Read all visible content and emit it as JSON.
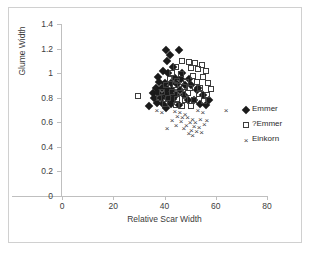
{
  "chart_data": {
    "type": "scatter",
    "title": "",
    "xlabel": "Relative Scar Width",
    "ylabel": "Glume Width",
    "xlim": [
      0,
      80
    ],
    "ylim": [
      0,
      1.4
    ],
    "xticks": [
      0,
      20,
      40,
      60,
      80
    ],
    "yticks": [
      0,
      0.2,
      0.4,
      0.6,
      0.8,
      1,
      1.2,
      1.4
    ],
    "xtick_labels": [
      "0",
      "20",
      "40",
      "60",
      "80"
    ],
    "ytick_labels": [
      "0",
      "0.2",
      "0.4",
      "0.6",
      "0.8",
      "1",
      "1.2",
      "1.4"
    ],
    "grid": false,
    "legend_position": "right",
    "series": [
      {
        "name": "Emmer",
        "marker": "filled-diamond",
        "color": "#1a1a1a",
        "points": [
          [
            40.5,
            1.19
          ],
          [
            42.0,
            1.15
          ],
          [
            45.5,
            1.19
          ],
          [
            41.0,
            1.1
          ],
          [
            43.5,
            1.05
          ],
          [
            39.5,
            1.02
          ],
          [
            41.5,
            1.0
          ],
          [
            47.0,
            1.0
          ],
          [
            37.5,
            0.97
          ],
          [
            44.0,
            0.96
          ],
          [
            46.5,
            0.95
          ],
          [
            49.5,
            0.95
          ],
          [
            38.0,
            0.93
          ],
          [
            40.0,
            0.92
          ],
          [
            42.5,
            0.92
          ],
          [
            45.0,
            0.91
          ],
          [
            48.0,
            0.9
          ],
          [
            50.5,
            0.9
          ],
          [
            36.5,
            0.88
          ],
          [
            39.0,
            0.88
          ],
          [
            41.0,
            0.87
          ],
          [
            43.0,
            0.86
          ],
          [
            46.0,
            0.86
          ],
          [
            52.5,
            0.86
          ],
          [
            35.5,
            0.84
          ],
          [
            37.5,
            0.84
          ],
          [
            40.0,
            0.83
          ],
          [
            42.0,
            0.83
          ],
          [
            44.5,
            0.82
          ],
          [
            47.5,
            0.82
          ],
          [
            55.0,
            0.82
          ],
          [
            36.0,
            0.8
          ],
          [
            38.5,
            0.8
          ],
          [
            41.5,
            0.79
          ],
          [
            43.5,
            0.79
          ],
          [
            49.0,
            0.78
          ],
          [
            51.5,
            0.78
          ],
          [
            57.5,
            0.78
          ],
          [
            37.0,
            0.76
          ],
          [
            39.5,
            0.75
          ],
          [
            42.5,
            0.75
          ],
          [
            45.5,
            0.74
          ],
          [
            34.0,
            0.73
          ],
          [
            40.5,
            0.72
          ],
          [
            53.0,
            0.88
          ],
          [
            54.0,
            0.75
          ],
          [
            56.0,
            0.74
          ]
        ]
      },
      {
        "name": "?Emmer",
        "marker": "open-square",
        "color": "#3d3d3d",
        "points": [
          [
            47.0,
            1.1
          ],
          [
            49.5,
            1.09
          ],
          [
            52.0,
            1.08
          ],
          [
            54.5,
            1.07
          ],
          [
            44.5,
            1.05
          ],
          [
            50.5,
            1.04
          ],
          [
            53.0,
            1.03
          ],
          [
            56.0,
            1.02
          ],
          [
            43.0,
            1.0
          ],
          [
            46.5,
            0.99
          ],
          [
            51.0,
            0.98
          ],
          [
            55.0,
            0.97
          ],
          [
            42.0,
            0.95
          ],
          [
            45.0,
            0.94
          ],
          [
            48.5,
            0.93
          ],
          [
            52.5,
            0.93
          ],
          [
            57.0,
            0.92
          ],
          [
            40.5,
            0.9
          ],
          [
            44.0,
            0.9
          ],
          [
            47.5,
            0.89
          ],
          [
            50.0,
            0.88
          ],
          [
            54.0,
            0.88
          ],
          [
            58.0,
            0.87
          ],
          [
            39.0,
            0.85
          ],
          [
            43.0,
            0.85
          ],
          [
            46.0,
            0.84
          ],
          [
            49.0,
            0.84
          ],
          [
            53.5,
            0.83
          ],
          [
            56.5,
            0.82
          ],
          [
            29.5,
            0.81
          ],
          [
            38.0,
            0.8
          ],
          [
            41.5,
            0.8
          ],
          [
            45.0,
            0.79
          ],
          [
            48.0,
            0.78
          ],
          [
            51.5,
            0.78
          ],
          [
            55.5,
            0.77
          ],
          [
            40.0,
            0.75
          ],
          [
            44.5,
            0.74
          ],
          [
            47.0,
            0.73
          ],
          [
            50.5,
            0.73
          ]
        ]
      },
      {
        "name": "Einkorn",
        "marker": "cross",
        "color": "#3d3d3d",
        "points": [
          [
            37.0,
            0.7
          ],
          [
            39.0,
            0.68
          ],
          [
            44.0,
            0.69
          ],
          [
            46.0,
            0.68
          ],
          [
            48.0,
            0.67
          ],
          [
            53.0,
            0.7
          ],
          [
            55.0,
            0.68
          ],
          [
            64.0,
            0.7
          ],
          [
            45.0,
            0.65
          ],
          [
            47.0,
            0.64
          ],
          [
            49.0,
            0.64
          ],
          [
            51.0,
            0.63
          ],
          [
            54.0,
            0.63
          ],
          [
            56.5,
            0.62
          ],
          [
            43.0,
            0.62
          ],
          [
            46.5,
            0.61
          ],
          [
            50.0,
            0.6
          ],
          [
            52.0,
            0.6
          ],
          [
            55.5,
            0.59
          ],
          [
            44.5,
            0.58
          ],
          [
            48.5,
            0.58
          ],
          [
            51.5,
            0.57
          ],
          [
            53.5,
            0.56
          ],
          [
            41.0,
            0.55
          ],
          [
            47.5,
            0.55
          ],
          [
            50.5,
            0.54
          ],
          [
            52.5,
            0.53
          ],
          [
            54.5,
            0.52
          ],
          [
            49.5,
            0.51
          ],
          [
            51.0,
            0.5
          ]
        ]
      }
    ]
  },
  "legend": {
    "items": [
      {
        "label": "Emmer",
        "marker": "filled-diamond"
      },
      {
        "label": "?Emmer",
        "marker": "open-square"
      },
      {
        "label": "Einkorn",
        "marker": "cross"
      }
    ]
  }
}
